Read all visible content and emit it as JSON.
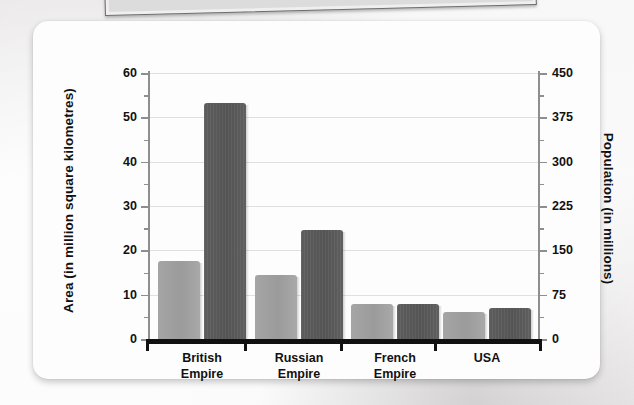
{
  "chart_data": {
    "type": "bar",
    "title": "",
    "categories": [
      "British Empire",
      "Russian Empire",
      "French Empire",
      "USA"
    ],
    "category_lines": [
      [
        "British",
        "Empire"
      ],
      [
        "Russian",
        "Empire"
      ],
      [
        "French",
        "Empire"
      ],
      [
        "USA",
        ""
      ]
    ],
    "series": [
      {
        "name": "Area (in million square kilometres)",
        "axis": "left",
        "color": "#a0a0a0",
        "values": [
          17.5,
          14.5,
          8.0,
          6.0
        ]
      },
      {
        "name": "Population (in millions)",
        "axis": "right",
        "color": "#585858",
        "values": [
          400,
          185,
          60,
          53
        ]
      }
    ],
    "xlabel": "",
    "ylabel": "Area (in million square kilometres)",
    "y2label": "Population (in millions)",
    "ylim": [
      0,
      60
    ],
    "y2lim": [
      0,
      450
    ],
    "yticks": [
      0,
      10,
      20,
      30,
      40,
      50,
      60
    ],
    "y2ticks": [
      0,
      75,
      150,
      225,
      300,
      375,
      450
    ],
    "grid": true,
    "legend": "none"
  },
  "axes": {
    "left": {
      "label": "Area (in million square kilometres)",
      "ticks": [
        "0",
        "10",
        "20",
        "30",
        "40",
        "50",
        "60"
      ]
    },
    "right": {
      "label": "Population (in millions)",
      "ticks": [
        "0",
        "75",
        "150",
        "225",
        "300",
        "375",
        "450"
      ]
    }
  },
  "categories": [
    {
      "line1": "British",
      "line2": "Empire"
    },
    {
      "line1": "Russian",
      "line2": "Empire"
    },
    {
      "line1": "French",
      "line2": "Empire"
    },
    {
      "line1": "USA",
      "line2": ""
    }
  ],
  "colors": {
    "area_bar": "#a0a0a0",
    "population_bar": "#585858",
    "card": "#fdfdfd",
    "page_background": "#eceaea",
    "axis": "#8e8e8e",
    "baseline": "#111111",
    "gridline": "#e0e0e0"
  }
}
